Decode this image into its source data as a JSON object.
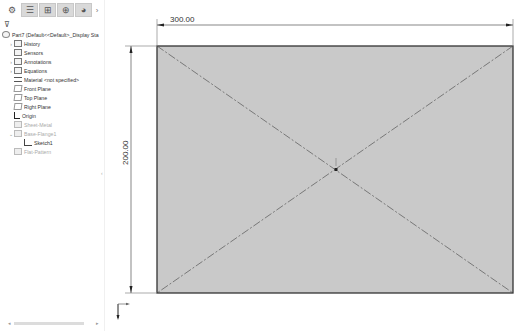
{
  "feature_manager": {
    "tabs": [
      {
        "name": "featuremanager-tab",
        "glyph": "⚙"
      },
      {
        "name": "propertymanager-tab",
        "glyph": "☰"
      },
      {
        "name": "configurationmanager-tab",
        "glyph": "⊞"
      },
      {
        "name": "dimxpert-tab",
        "glyph": "⊕"
      },
      {
        "name": "display-manager-tab",
        "glyph": "◕"
      }
    ],
    "more_glyph": "›",
    "filter_glyph": "⊽",
    "part_label": "Part7 (Default<<Default>_Display Sta",
    "items": [
      {
        "label": "History",
        "icon": "history-icon",
        "expandable": true,
        "dimmed": false
      },
      {
        "label": "Sensors",
        "icon": "sensors-icon",
        "expandable": false,
        "dimmed": false
      },
      {
        "label": "Annotations",
        "icon": "annotations-icon",
        "expandable": true,
        "dimmed": false
      },
      {
        "label": "Equations",
        "icon": "equations-icon",
        "expandable": true,
        "dimmed": false
      },
      {
        "label": "Material <not specified>",
        "icon": "material-icon",
        "expandable": false,
        "dimmed": false
      },
      {
        "label": "Front Plane",
        "icon": "plane-icon",
        "expandable": false,
        "dimmed": false
      },
      {
        "label": "Top Plane",
        "icon": "plane-icon",
        "expandable": false,
        "dimmed": false
      },
      {
        "label": "Right Plane",
        "icon": "plane-icon",
        "expandable": false,
        "dimmed": false
      },
      {
        "label": "Origin",
        "icon": "origin-icon",
        "expandable": false,
        "dimmed": false
      },
      {
        "label": "Sheet-Metal",
        "icon": "sheet-metal-icon",
        "expandable": false,
        "dimmed": true
      },
      {
        "label": "Base-Flange1",
        "icon": "base-flange-icon",
        "expandable": true,
        "dimmed": true
      },
      {
        "label": "Sketch1",
        "icon": "sketch-icon",
        "expandable": false,
        "dimmed": false,
        "indent": true
      },
      {
        "label": "Flat-Pattern",
        "icon": "flat-pattern-icon",
        "expandable": false,
        "dimmed": true
      }
    ],
    "collapse_glyph": "‹",
    "scroll_left": "◂",
    "scroll_right": "▸"
  },
  "graphics_area": {
    "dimension_horizontal": "300.00",
    "dimension_vertical": "200.00",
    "sketch_fill": "#c9c9c9",
    "edge_color": "#333333"
  }
}
